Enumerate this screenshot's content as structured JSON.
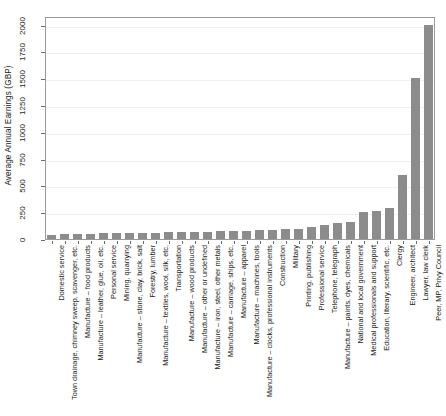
{
  "chart_data": {
    "type": "bar",
    "title": "",
    "subtitle": "",
    "xlabel": "",
    "ylabel": "Average Annual Earnings (GBP)",
    "ylim": [
      0,
      2080
    ],
    "yticks": [
      0,
      250,
      500,
      750,
      1000,
      1250,
      1500,
      1750,
      2000
    ],
    "ytick_labels": [
      "0",
      "250",
      "500",
      "750",
      "1000",
      "1250",
      "1500",
      "1750",
      "2000"
    ],
    "grid": true,
    "legend": "none",
    "bar_color": "#8c8c8c",
    "categories": [
      "Domestic service",
      "Town drainage, chimney sweep, scavenger, etc.",
      "Manufacture – food products",
      "Manufacture – leather, glue, oil, etc.",
      "Personal service",
      "Mining, quarrying",
      "Manufacture – stone, clay, brick, salt",
      "Forestry, lumber",
      "Manufacture – textiles, wool, silk, etc.",
      "Transportation",
      "Manufacture – wood products",
      "Manufacture – other or undefined",
      "Manufacture – iron, steel, other metals",
      "Manufacture – carriage, ships, etc.",
      "Manufacture – apparel",
      "Manufacture – machines, tools",
      "Manufacture – clocks, professional instruments",
      "Construction",
      "Military",
      "Printing, publishing",
      "Professional service",
      "Telephone, telegraph",
      "Manufacture – paints, dyes, chemicals",
      "National and local government",
      "Medical professionals and support",
      "Education, literary, scientific, etc.",
      "Clergy",
      "Engineer, architect",
      "Lawyer, law clerk",
      "Peer, MP, Privy Council"
    ],
    "values": [
      40,
      45,
      48,
      50,
      52,
      55,
      57,
      58,
      60,
      62,
      64,
      66,
      70,
      72,
      74,
      78,
      80,
      85,
      90,
      95,
      110,
      128,
      150,
      155,
      250,
      265,
      290,
      600,
      1500,
      2000
    ]
  }
}
